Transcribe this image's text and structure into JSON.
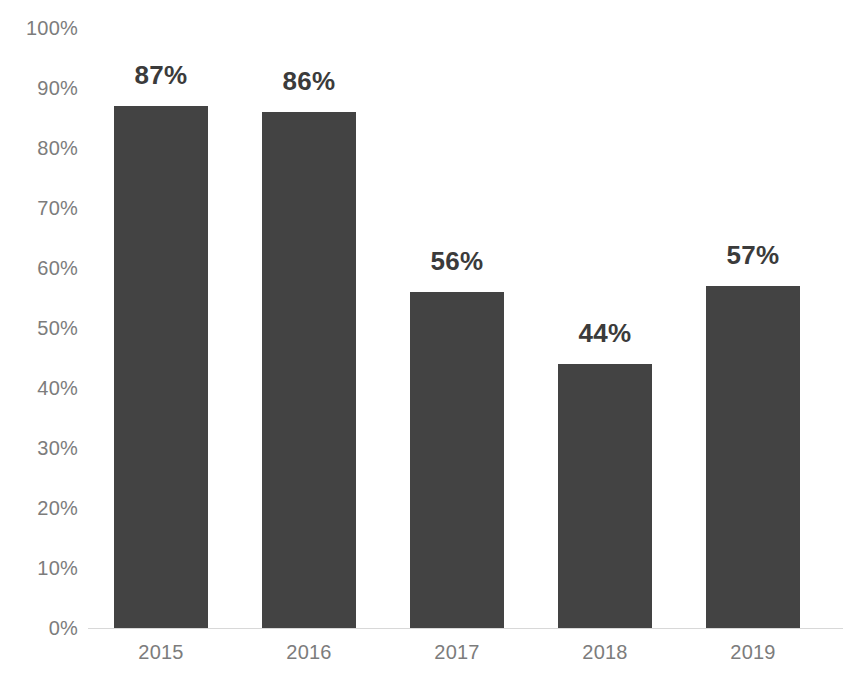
{
  "chart_data": {
    "type": "bar",
    "title": "",
    "subtitle": "",
    "xlabel": "",
    "ylabel": "",
    "categories": [
      "2015",
      "2016",
      "2017",
      "2018",
      "2019"
    ],
    "values": [
      87,
      86,
      56,
      44,
      57
    ],
    "data_labels": [
      "87%",
      "86%",
      "56%",
      "44%",
      "57%"
    ],
    "ylim": [
      0,
      100
    ],
    "y_tick_values": [
      100,
      90,
      80,
      70,
      60,
      50,
      40,
      30,
      20,
      10,
      0
    ],
    "y_tick_labels": [
      "100%",
      "90%",
      "80%",
      "70%",
      "60%",
      "50%",
      "40%",
      "30%",
      "20%",
      "10%",
      "0%"
    ],
    "grid": false,
    "legend": null,
    "legend_position": "none",
    "annotations": [],
    "colors": {
      "bar_fill": "#434343",
      "data_label": "#3b3b3b",
      "axis_label": "#7c7c7c",
      "baseline": "#d8d8d8",
      "background": "#ffffff"
    }
  }
}
